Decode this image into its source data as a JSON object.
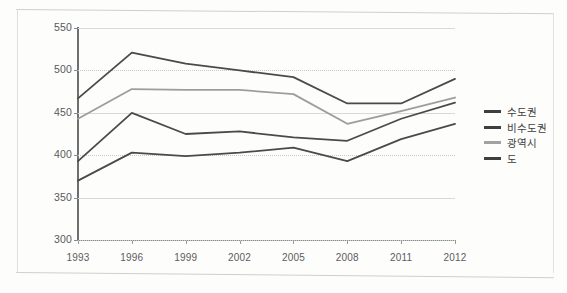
{
  "chart_data": {
    "type": "line",
    "title": "",
    "xlabel": "",
    "ylabel": "",
    "categories": [
      "1993",
      "1996",
      "1999",
      "2002",
      "2005",
      "2008",
      "2011",
      "2012"
    ],
    "ylim": [
      300,
      550
    ],
    "yticks": [
      300,
      350,
      400,
      450,
      500,
      550
    ],
    "grid": true,
    "legend_position": "right",
    "series": [
      {
        "name": "수도권",
        "color": "#4a4a4a",
        "values": [
          393,
          450,
          425,
          428,
          421,
          417,
          443,
          462
        ]
      },
      {
        "name": "비수도권",
        "color": "#4a4a4a",
        "values": [
          467,
          521,
          508,
          500,
          492,
          461,
          461,
          490
        ]
      },
      {
        "name": "광역시",
        "color": "#9d9d9d",
        "values": [
          443,
          478,
          477,
          477,
          472,
          437,
          452,
          468
        ]
      },
      {
        "name": "도",
        "color": "#4a4a4a",
        "values": [
          370,
          403,
          399,
          403,
          409,
          393,
          419,
          437
        ]
      }
    ]
  },
  "legend": {
    "items": [
      {
        "label": "수도권",
        "color": "#3f3f3f"
      },
      {
        "label": "비수도권",
        "color": "#3f3f3f"
      },
      {
        "label": "광역시",
        "color": "#a2a2a2"
      },
      {
        "label": "도",
        "color": "#3f3f3f"
      }
    ]
  }
}
